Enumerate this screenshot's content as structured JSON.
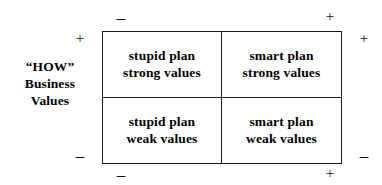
{
  "diagram": {
    "axes": {
      "vertical_label_lines": [
        "“HOW”",
        "Business",
        "Values"
      ],
      "top_left_sign": "–",
      "top_right_sign": "+",
      "bottom_left_sign": "–",
      "bottom_right_sign": "+",
      "left_top_sign": "+",
      "left_bottom_sign": "–",
      "right_top_sign": "+",
      "right_bottom_sign": "–"
    },
    "quadrants": {
      "top_left": {
        "line1": "stupid plan",
        "line2": "strong values"
      },
      "top_right": {
        "line1": "smart plan",
        "line2": "strong values"
      },
      "bottom_left": {
        "line1": "stupid plan",
        "line2": "weak values"
      },
      "bottom_right": {
        "line1": "smart plan",
        "line2": "weak values"
      }
    },
    "colors": {
      "background": "#ffffff",
      "border": "#1a1a1a",
      "text": "#000000"
    }
  }
}
